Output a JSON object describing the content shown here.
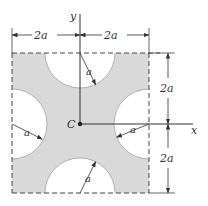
{
  "diagram": {
    "colors": {
      "fill": "#d9d9d9",
      "line": "#333333",
      "background": "#ffffff"
    },
    "axes": {
      "x_label": "x",
      "y_label": "y"
    },
    "centroid_label": "C",
    "dimensions": {
      "top_left": "2a",
      "top_right": "2a",
      "right_upper": "2a",
      "right_lower": "2a"
    },
    "radius_labels": {
      "top": "a",
      "left": "a",
      "right": "a",
      "bottom": "a"
    }
  }
}
